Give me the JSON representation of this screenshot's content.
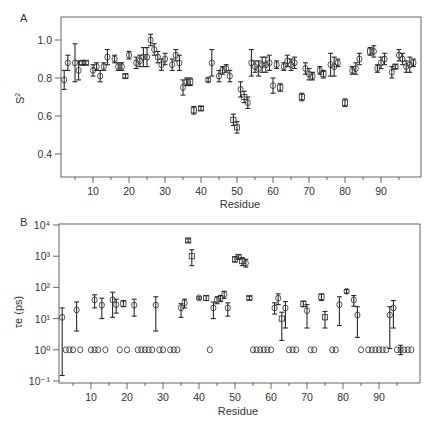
{
  "chart_data": [
    {
      "panel": "A",
      "type": "scatter",
      "title": "",
      "xlabel": "Residue",
      "ylabel": "S²",
      "xlim": [
        0,
        100
      ],
      "ylim": [
        0.3,
        1.08
      ],
      "xticks": [
        10,
        20,
        30,
        40,
        50,
        60,
        70,
        80,
        90
      ],
      "yticks": [
        0.4,
        0.6,
        0.8,
        1.0
      ],
      "ytick_labels": [
        "0.4",
        "0.6",
        "0.8",
        "1.0"
      ],
      "grid": false,
      "legend": null,
      "markers": "open circles (model 2) / open squares (other models) with error bars",
      "points": [
        {
          "x": 2,
          "y": 0.79,
          "err": 0.05,
          "m": "o"
        },
        {
          "x": 3,
          "y": 0.88,
          "err": 0.04,
          "m": "o"
        },
        {
          "x": 5,
          "y": 0.88,
          "err": 0.1,
          "m": "o"
        },
        {
          "x": 6,
          "y": 0.84,
          "err": 0.05,
          "m": "o"
        },
        {
          "x": 7,
          "y": 0.88,
          "err": 0.01,
          "m": "s"
        },
        {
          "x": 8,
          "y": 0.88,
          "err": 0.01,
          "m": "s"
        },
        {
          "x": 10,
          "y": 0.84,
          "err": 0.03,
          "m": "o"
        },
        {
          "x": 11,
          "y": 0.86,
          "err": 0.02,
          "m": "o"
        },
        {
          "x": 12,
          "y": 0.81,
          "err": 0.03,
          "m": "o"
        },
        {
          "x": 13,
          "y": 0.86,
          "err": 0.02,
          "m": "o"
        },
        {
          "x": 14,
          "y": 0.91,
          "err": 0.04,
          "m": "o"
        },
        {
          "x": 16,
          "y": 0.9,
          "err": 0.02,
          "m": "o"
        },
        {
          "x": 17,
          "y": 0.86,
          "err": 0.02,
          "m": "o"
        },
        {
          "x": 18,
          "y": 0.86,
          "err": 0.02,
          "m": "o"
        },
        {
          "x": 19,
          "y": 0.81,
          "err": 0.01,
          "m": "s"
        },
        {
          "x": 20,
          "y": 0.92,
          "err": 0.02,
          "m": "o"
        },
        {
          "x": 22,
          "y": 0.88,
          "err": 0.03,
          "m": "o"
        },
        {
          "x": 23,
          "y": 0.89,
          "err": 0.03,
          "m": "o"
        },
        {
          "x": 24,
          "y": 0.91,
          "err": 0.05,
          "m": "o"
        },
        {
          "x": 25,
          "y": 0.91,
          "err": 0.05,
          "m": "o"
        },
        {
          "x": 26,
          "y": 1.0,
          "err": 0.03,
          "m": "o"
        },
        {
          "x": 27,
          "y": 0.95,
          "err": 0.03,
          "m": "o"
        },
        {
          "x": 28,
          "y": 0.91,
          "err": 0.03,
          "m": "o"
        },
        {
          "x": 29,
          "y": 0.87,
          "err": 0.03,
          "m": "o"
        },
        {
          "x": 30,
          "y": 0.9,
          "err": 0.03,
          "m": "o"
        },
        {
          "x": 32,
          "y": 0.87,
          "err": 0.03,
          "m": "o"
        },
        {
          "x": 33,
          "y": 0.92,
          "err": 0.03,
          "m": "o"
        },
        {
          "x": 34,
          "y": 0.88,
          "err": 0.04,
          "m": "o"
        },
        {
          "x": 35,
          "y": 0.75,
          "err": 0.04,
          "m": "o"
        },
        {
          "x": 36,
          "y": 0.78,
          "err": 0.02,
          "m": "o"
        },
        {
          "x": 37,
          "y": 0.78,
          "err": 0.02,
          "m": "s"
        },
        {
          "x": 38,
          "y": 0.63,
          "err": 0.02,
          "m": "s"
        },
        {
          "x": 40,
          "y": 0.64,
          "err": 0.01,
          "m": "s"
        },
        {
          "x": 42,
          "y": 0.79,
          "err": 0.01,
          "m": "o"
        },
        {
          "x": 43,
          "y": 0.88,
          "err": 0.07,
          "m": "o"
        },
        {
          "x": 45,
          "y": 0.81,
          "err": 0.03,
          "m": "o"
        },
        {
          "x": 46,
          "y": 0.84,
          "err": 0.02,
          "m": "o"
        },
        {
          "x": 47,
          "y": 0.85,
          "err": 0.02,
          "m": "o"
        },
        {
          "x": 48,
          "y": 0.81,
          "err": 0.03,
          "m": "o"
        },
        {
          "x": 49,
          "y": 0.58,
          "err": 0.03,
          "m": "s"
        },
        {
          "x": 50,
          "y": 0.54,
          "err": 0.03,
          "m": "s"
        },
        {
          "x": 51,
          "y": 0.74,
          "err": 0.04,
          "m": "o"
        },
        {
          "x": 52,
          "y": 0.7,
          "err": 0.03,
          "m": "s"
        },
        {
          "x": 53,
          "y": 0.67,
          "err": 0.03,
          "m": "o"
        },
        {
          "x": 54,
          "y": 0.88,
          "err": 0.07,
          "m": "o"
        },
        {
          "x": 55,
          "y": 0.86,
          "err": 0.03,
          "m": "o"
        },
        {
          "x": 56,
          "y": 0.85,
          "err": 0.04,
          "m": "o"
        },
        {
          "x": 57,
          "y": 0.87,
          "err": 0.04,
          "m": "o"
        },
        {
          "x": 58,
          "y": 0.87,
          "err": 0.04,
          "m": "o"
        },
        {
          "x": 59,
          "y": 0.88,
          "err": 0.04,
          "m": "o"
        },
        {
          "x": 60,
          "y": 0.76,
          "err": 0.04,
          "m": "o"
        },
        {
          "x": 61,
          "y": 0.87,
          "err": 0.02,
          "m": "o"
        },
        {
          "x": 62,
          "y": 0.75,
          "err": 0.02,
          "m": "s"
        },
        {
          "x": 63,
          "y": 0.86,
          "err": 0.02,
          "m": "o"
        },
        {
          "x": 64,
          "y": 0.89,
          "err": 0.03,
          "m": "o"
        },
        {
          "x": 65,
          "y": 0.87,
          "err": 0.03,
          "m": "o"
        },
        {
          "x": 66,
          "y": 0.88,
          "err": 0.03,
          "m": "o"
        },
        {
          "x": 68,
          "y": 0.7,
          "err": 0.02,
          "m": "s"
        },
        {
          "x": 69,
          "y": 0.85,
          "err": 0.03,
          "m": "o"
        },
        {
          "x": 70,
          "y": 0.82,
          "err": 0.03,
          "m": "o"
        },
        {
          "x": 71,
          "y": 0.81,
          "err": 0.02,
          "m": "o"
        },
        {
          "x": 73,
          "y": 0.84,
          "err": 0.02,
          "m": "o"
        },
        {
          "x": 74,
          "y": 0.82,
          "err": 0.02,
          "m": "s"
        },
        {
          "x": 76,
          "y": 0.87,
          "err": 0.06,
          "m": "o"
        },
        {
          "x": 77,
          "y": 0.86,
          "err": 0.05,
          "m": "o"
        },
        {
          "x": 78,
          "y": 0.88,
          "err": 0.02,
          "m": "o"
        },
        {
          "x": 80,
          "y": 0.67,
          "err": 0.02,
          "m": "s"
        },
        {
          "x": 82,
          "y": 0.84,
          "err": 0.02,
          "m": "o"
        },
        {
          "x": 83,
          "y": 0.85,
          "err": 0.03,
          "m": "o"
        },
        {
          "x": 84,
          "y": 0.9,
          "err": 0.03,
          "m": "o"
        },
        {
          "x": 87,
          "y": 0.94,
          "err": 0.02,
          "m": "s"
        },
        {
          "x": 88,
          "y": 0.94,
          "err": 0.03,
          "m": "o"
        },
        {
          "x": 89,
          "y": 0.85,
          "err": 0.02,
          "m": "o"
        },
        {
          "x": 90,
          "y": 0.88,
          "err": 0.03,
          "m": "o"
        },
        {
          "x": 91,
          "y": 0.9,
          "err": 0.03,
          "m": "o"
        },
        {
          "x": 93,
          "y": 0.83,
          "err": 0.03,
          "m": "o"
        },
        {
          "x": 94,
          "y": 0.86,
          "err": 0.01,
          "m": "s"
        },
        {
          "x": 95,
          "y": 0.92,
          "err": 0.03,
          "m": "o"
        },
        {
          "x": 96,
          "y": 0.9,
          "err": 0.03,
          "m": "o"
        },
        {
          "x": 97,
          "y": 0.86,
          "err": 0.03,
          "m": "o"
        },
        {
          "x": 98,
          "y": 0.87,
          "err": 0.04,
          "m": "o"
        },
        {
          "x": 99,
          "y": 0.88,
          "err": 0.02,
          "m": "o"
        }
      ]
    },
    {
      "panel": "B",
      "type": "scatter",
      "title": "",
      "xlabel": "Residue",
      "ylabel": "τe (ps)",
      "yscale": "log",
      "xlim": [
        0,
        100
      ],
      "ylim": [
        0.1,
        10000
      ],
      "xticks": [
        10,
        20,
        30,
        40,
        50,
        60,
        70,
        80,
        90
      ],
      "yticks": [
        0.1,
        1,
        10,
        100,
        1000,
        10000
      ],
      "ytick_labels": [
        "10⁻¹",
        "10⁰",
        "10¹",
        "10²",
        "10³",
        "10⁴"
      ],
      "grid": false,
      "legend": null,
      "note": "Open circles at 10⁰ mark residues with no τe fitted (placeholder)",
      "points": [
        {
          "x": 2,
          "y": 11,
          "lo": 0.15,
          "hi": 22,
          "m": "o"
        },
        {
          "x": 6,
          "y": 19,
          "lo": 4,
          "hi": 34,
          "m": "o"
        },
        {
          "x": 11,
          "y": 40,
          "lo": 22,
          "hi": 58,
          "m": "o"
        },
        {
          "x": 13,
          "y": 27,
          "lo": 10,
          "hi": 45,
          "m": "o"
        },
        {
          "x": 16,
          "y": 40,
          "lo": 11,
          "hi": 70,
          "m": "o"
        },
        {
          "x": 17,
          "y": 28,
          "lo": 15,
          "hi": 42,
          "m": "o"
        },
        {
          "x": 19,
          "y": 30,
          "lo": 24,
          "hi": 38,
          "m": "s"
        },
        {
          "x": 22,
          "y": 27,
          "lo": 12,
          "hi": 42,
          "m": "o"
        },
        {
          "x": 28,
          "y": 27,
          "lo": 4,
          "hi": 50,
          "m": "o"
        },
        {
          "x": 35,
          "y": 22,
          "lo": 11,
          "hi": 30,
          "m": "o"
        },
        {
          "x": 36,
          "y": 32,
          "lo": 22,
          "hi": 42,
          "m": "o"
        },
        {
          "x": 37,
          "y": 3200,
          "lo": 2800,
          "hi": 3600,
          "m": "s"
        },
        {
          "x": 38,
          "y": 1000,
          "lo": 500,
          "hi": 1600,
          "m": "s"
        },
        {
          "x": 40,
          "y": 46,
          "lo": 42,
          "hi": 50,
          "m": "o"
        },
        {
          "x": 42,
          "y": 46,
          "lo": 38,
          "hi": 54,
          "m": "s"
        },
        {
          "x": 44,
          "y": 22,
          "lo": 10,
          "hi": 34,
          "m": "o"
        },
        {
          "x": 45,
          "y": 40,
          "lo": 30,
          "hi": 50,
          "m": "o"
        },
        {
          "x": 46,
          "y": 45,
          "lo": 35,
          "hi": 55,
          "m": "o"
        },
        {
          "x": 47,
          "y": 60,
          "lo": 45,
          "hi": 75,
          "m": "o"
        },
        {
          "x": 48,
          "y": 22,
          "lo": 12,
          "hi": 32,
          "m": "o"
        },
        {
          "x": 50,
          "y": 800,
          "lo": 650,
          "hi": 950,
          "m": "s"
        },
        {
          "x": 51,
          "y": 950,
          "lo": 800,
          "hi": 1100,
          "m": "s"
        },
        {
          "x": 52,
          "y": 700,
          "lo": 500,
          "hi": 900,
          "m": "s"
        },
        {
          "x": 53,
          "y": 600,
          "lo": 450,
          "hi": 800,
          "m": "o"
        },
        {
          "x": 54,
          "y": 46,
          "lo": 40,
          "hi": 52,
          "m": "s"
        },
        {
          "x": 61,
          "y": 22,
          "lo": 14,
          "hi": 32,
          "m": "o"
        },
        {
          "x": 62,
          "y": 45,
          "lo": 28,
          "hi": 62,
          "m": "o"
        },
        {
          "x": 63,
          "y": 10,
          "lo": 2,
          "hi": 16,
          "m": "s"
        },
        {
          "x": 64,
          "y": 22,
          "lo": 5,
          "hi": 35,
          "m": "o"
        },
        {
          "x": 69,
          "y": 30,
          "lo": 24,
          "hi": 36,
          "m": "s"
        },
        {
          "x": 70,
          "y": 18,
          "lo": 5,
          "hi": 28,
          "m": "o"
        },
        {
          "x": 74,
          "y": 50,
          "lo": 38,
          "hi": 62,
          "m": "s"
        },
        {
          "x": 75,
          "y": 11,
          "lo": 5,
          "hi": 17,
          "m": "s"
        },
        {
          "x": 79,
          "y": 28,
          "lo": 6,
          "hi": 50,
          "m": "o"
        },
        {
          "x": 81,
          "y": 75,
          "lo": 65,
          "hi": 85,
          "m": "o"
        },
        {
          "x": 83,
          "y": 40,
          "lo": 25,
          "hi": 55,
          "m": "o"
        },
        {
          "x": 84,
          "y": 13,
          "lo": 2.5,
          "hi": 24,
          "m": "o"
        },
        {
          "x": 93,
          "y": 13,
          "lo": 1.1,
          "hi": 24,
          "m": "o"
        },
        {
          "x": 94,
          "y": 22,
          "lo": 5,
          "hi": 38,
          "m": "o"
        },
        {
          "x": 96,
          "y": 1,
          "lo": 0.7,
          "hi": 1.4,
          "m": "o"
        }
      ],
      "baseline_points_x": [
        3,
        4,
        5,
        7,
        10,
        11,
        12,
        14,
        18,
        20,
        23,
        24,
        25,
        26,
        27,
        29,
        30,
        32,
        33,
        34,
        43,
        55,
        56,
        57,
        58,
        59,
        60,
        65,
        66,
        67,
        71,
        72,
        77,
        78,
        85,
        87,
        88,
        89,
        90,
        91,
        92,
        95,
        97,
        98,
        99
      ],
      "baseline_value": 1
    }
  ],
  "panels": {
    "a": {
      "letter": "A",
      "ylabel_main": "S",
      "ylabel_sup": "2",
      "xlabel": "Residue",
      "yticks": [
        "0.4",
        "0.6",
        "0.8",
        "1.0"
      ],
      "xticks": [
        "10",
        "20",
        "30",
        "40",
        "50",
        "60",
        "70",
        "80",
        "90"
      ]
    },
    "b": {
      "letter": "B",
      "ylabel": "τe (ps)",
      "xlabel": "Residue",
      "yticks": [
        "10⁻¹",
        "10⁰",
        "10¹",
        "10²",
        "10³",
        "10⁴"
      ],
      "xticks": [
        "10",
        "20",
        "30",
        "40",
        "50",
        "60",
        "70",
        "80",
        "90"
      ]
    }
  },
  "colors": {
    "ink": "#2a2a2a",
    "frame": "#555555",
    "text": "#333333",
    "background": "#ffffff"
  }
}
